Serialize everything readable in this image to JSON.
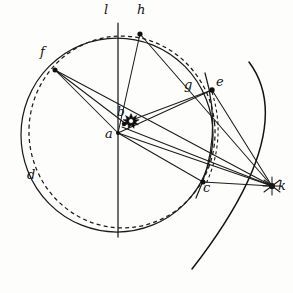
{
  "figure": {
    "background_color": "#fdfdfc",
    "ink_color": "#141414",
    "width": 293,
    "height": 293
  },
  "labels": {
    "a": "a",
    "b": "b",
    "c": "c",
    "d": "d",
    "e": "e",
    "f": "f",
    "g": "g",
    "h": "h",
    "k": "k",
    "l": "l"
  },
  "label_positions": {
    "a": {
      "x": 105,
      "y": 133
    },
    "b": {
      "x": 117,
      "y": 112
    },
    "c": {
      "x": 203,
      "y": 186
    },
    "d": {
      "x": 27,
      "y": 174
    },
    "e": {
      "x": 216,
      "y": 80
    },
    "f": {
      "x": 40,
      "y": 51
    },
    "g": {
      "x": 184,
      "y": 83
    },
    "h": {
      "x": 137,
      "y": 8
    },
    "k": {
      "x": 278,
      "y": 184
    },
    "l": {
      "x": 104,
      "y": 8
    }
  },
  "points": [
    {
      "name": "a",
      "x": 118,
      "y": 133,
      "marker": "none",
      "role": "circle-center"
    },
    {
      "name": "b",
      "x": 124,
      "y": 121,
      "marker": "dot",
      "role": "eccentric-point"
    },
    {
      "name": "c",
      "x": 203,
      "y": 182,
      "marker": "dot",
      "role": "circle-point"
    },
    {
      "name": "e",
      "x": 212,
      "y": 90,
      "marker": "dot",
      "role": "circle-point"
    },
    {
      "name": "f",
      "x": 55,
      "y": 70,
      "marker": "dot",
      "role": "circle-point"
    },
    {
      "name": "h",
      "x": 140,
      "y": 34,
      "marker": "dot",
      "role": "circle-point"
    },
    {
      "name": "k",
      "x": 272,
      "y": 186,
      "marker": "star",
      "role": "external-center"
    }
  ],
  "star_symbol": {
    "x": 131,
    "y": 121,
    "radius": 7,
    "spikes": 8,
    "role": "sun-glyph"
  },
  "circles": [
    {
      "name": "solid-main-circle",
      "style": "solid",
      "cx": 117,
      "cy": 135,
      "rx": 96,
      "ry": 97,
      "rotation": 0,
      "label": "d"
    },
    {
      "name": "dashed-eccentric-circle",
      "style": "dashed",
      "cx": 122,
      "cy": 132,
      "rx": 93,
      "ry": 96,
      "rotation": -6
    }
  ],
  "arcs": [
    {
      "name": "outer-right-arc",
      "style": "solid",
      "from": {
        "x": 249,
        "y": 62
      },
      "to": {
        "x": 192,
        "y": 269
      },
      "bulge": {
        "x": 287,
        "y": 168
      }
    },
    {
      "name": "inner-right-arc-through-c",
      "style": "solid",
      "from": {
        "x": 205,
        "y": 73
      },
      "to": {
        "x": 196,
        "y": 198
      },
      "bulge": {
        "x": 216,
        "y": 138
      }
    },
    {
      "name": "dashed-chord-arc-e-c",
      "style": "dashed-fine",
      "from": {
        "x": 212,
        "y": 92
      },
      "to": {
        "x": 205,
        "y": 186
      },
      "bulge": {
        "x": 219,
        "y": 140
      }
    }
  ],
  "lines": [
    {
      "name": "axis-line-l",
      "from": {
        "x": 118,
        "y": 23
      },
      "to": {
        "x": 118,
        "y": 237
      },
      "style": "solid"
    },
    {
      "name": "line-a-h",
      "from": {
        "x": 118,
        "y": 133
      },
      "to": {
        "x": 140,
        "y": 34
      },
      "style": "thin"
    },
    {
      "name": "line-a-f",
      "from": {
        "x": 118,
        "y": 133
      },
      "to": {
        "x": 55,
        "y": 70
      },
      "style": "thin"
    },
    {
      "name": "line-a-e",
      "from": {
        "x": 118,
        "y": 133
      },
      "to": {
        "x": 212,
        "y": 90
      },
      "style": "thin"
    },
    {
      "name": "line-a-c",
      "from": {
        "x": 118,
        "y": 133
      },
      "to": {
        "x": 203,
        "y": 182
      },
      "style": "thin"
    },
    {
      "name": "line-a-k",
      "from": {
        "x": 118,
        "y": 133
      },
      "to": {
        "x": 272,
        "y": 186
      },
      "style": "thin"
    },
    {
      "name": "line-f-k",
      "from": {
        "x": 55,
        "y": 70
      },
      "to": {
        "x": 272,
        "y": 186
      },
      "style": "thin"
    },
    {
      "name": "line-h-k",
      "from": {
        "x": 140,
        "y": 34
      },
      "to": {
        "x": 272,
        "y": 186
      },
      "style": "thin"
    },
    {
      "name": "line-e-k",
      "from": {
        "x": 212,
        "y": 90
      },
      "to": {
        "x": 272,
        "y": 186
      },
      "style": "thin"
    },
    {
      "name": "line-c-k",
      "from": {
        "x": 203,
        "y": 182
      },
      "to": {
        "x": 272,
        "y": 186
      },
      "style": "thin"
    },
    {
      "name": "line-b-e",
      "from": {
        "x": 124,
        "y": 123
      },
      "to": {
        "x": 212,
        "y": 90
      },
      "style": "thin"
    },
    {
      "name": "line-b-k",
      "from": {
        "x": 124,
        "y": 126
      },
      "to": {
        "x": 272,
        "y": 186
      },
      "style": "thin"
    },
    {
      "name": "line-f-b",
      "from": {
        "x": 55,
        "y": 70
      },
      "to": {
        "x": 124,
        "y": 124
      },
      "style": "thin"
    }
  ]
}
